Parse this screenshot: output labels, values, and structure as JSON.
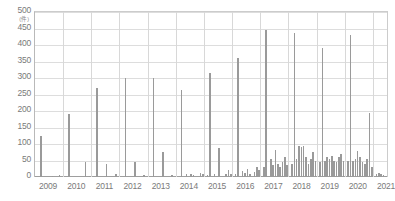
{
  "chart_data": {
    "type": "bar",
    "title": "",
    "subtitle": "",
    "xlabel": "",
    "ylabel": "",
    "yunit": "(件)",
    "ylim": [
      0,
      500
    ],
    "ytick_step": 50,
    "yticks": [
      0,
      50,
      100,
      150,
      200,
      250,
      300,
      350,
      400,
      450,
      500
    ],
    "ytick_labels": [
      "0",
      "50",
      "100",
      "150",
      "200",
      "250",
      "300",
      "350",
      "400",
      "450",
      "500"
    ],
    "xticks": [
      2009,
      2010,
      2011,
      2012,
      2013,
      2014,
      2015,
      2016,
      2017,
      2018,
      2019,
      2020,
      2021
    ],
    "xtick_labels": [
      "2009",
      "2010",
      "2011",
      "2012",
      "2013",
      "2014",
      "2015",
      "2016",
      "2017",
      "2018",
      "2019",
      "2020",
      "2021"
    ],
    "grid": true,
    "legend": null,
    "bar_color": "#9a9a9a",
    "grid_color": "#dddddd",
    "axis_color": "#9e9e9e",
    "x_period": "monthly",
    "x_start": "2009-01",
    "x_end": "2021-06",
    "categories": [
      "2009-01",
      "2009-02",
      "2009-03",
      "2009-04",
      "2009-05",
      "2009-06",
      "2009-07",
      "2009-08",
      "2009-09",
      "2009-10",
      "2009-11",
      "2009-12",
      "2010-01",
      "2010-02",
      "2010-03",
      "2010-04",
      "2010-05",
      "2010-06",
      "2010-07",
      "2010-08",
      "2010-09",
      "2010-10",
      "2010-11",
      "2010-12",
      "2011-01",
      "2011-02",
      "2011-03",
      "2011-04",
      "2011-05",
      "2011-06",
      "2011-07",
      "2011-08",
      "2011-09",
      "2011-10",
      "2011-11",
      "2011-12",
      "2012-01",
      "2012-02",
      "2012-03",
      "2012-04",
      "2012-05",
      "2012-06",
      "2012-07",
      "2012-08",
      "2012-09",
      "2012-10",
      "2012-11",
      "2012-12",
      "2013-01",
      "2013-02",
      "2013-03",
      "2013-04",
      "2013-05",
      "2013-06",
      "2013-07",
      "2013-08",
      "2013-09",
      "2013-10",
      "2013-11",
      "2013-12",
      "2014-01",
      "2014-02",
      "2014-03",
      "2014-04",
      "2014-05",
      "2014-06",
      "2014-07",
      "2014-08",
      "2014-09",
      "2014-10",
      "2014-11",
      "2014-12",
      "2015-01",
      "2015-02",
      "2015-03",
      "2015-04",
      "2015-05",
      "2015-06",
      "2015-07",
      "2015-08",
      "2015-09",
      "2015-10",
      "2015-11",
      "2015-12",
      "2016-01",
      "2016-02",
      "2016-03",
      "2016-04",
      "2016-05",
      "2016-06",
      "2016-07",
      "2016-08",
      "2016-09",
      "2016-10",
      "2016-11",
      "2016-12",
      "2017-01",
      "2017-02",
      "2017-03",
      "2017-04",
      "2017-05",
      "2017-06",
      "2017-07",
      "2017-08",
      "2017-09",
      "2017-10",
      "2017-11",
      "2017-12",
      "2018-01",
      "2018-02",
      "2018-03",
      "2018-04",
      "2018-05",
      "2018-06",
      "2018-07",
      "2018-08",
      "2018-09",
      "2018-10",
      "2018-11",
      "2018-12",
      "2019-01",
      "2019-02",
      "2019-03",
      "2019-04",
      "2019-05",
      "2019-06",
      "2019-07",
      "2019-08",
      "2019-09",
      "2019-10",
      "2019-11",
      "2019-12",
      "2020-01",
      "2020-02",
      "2020-03",
      "2020-04",
      "2020-05",
      "2020-06",
      "2020-07",
      "2020-08",
      "2020-09",
      "2020-10",
      "2020-11",
      "2020-12",
      "2021-01",
      "2021-02",
      "2021-03",
      "2021-04",
      "2021-05",
      "2021-06"
    ],
    "values": [
      0,
      0,
      125,
      0,
      0,
      0,
      0,
      3,
      0,
      0,
      5,
      0,
      0,
      0,
      190,
      0,
      0,
      0,
      0,
      0,
      0,
      45,
      0,
      3,
      0,
      0,
      270,
      0,
      0,
      0,
      40,
      0,
      0,
      0,
      8,
      0,
      0,
      0,
      300,
      0,
      0,
      0,
      45,
      0,
      0,
      0,
      5,
      0,
      0,
      0,
      300,
      0,
      0,
      0,
      75,
      0,
      0,
      0,
      6,
      0,
      0,
      0,
      265,
      0,
      8,
      0,
      10,
      5,
      0,
      0,
      12,
      8,
      0,
      5,
      315,
      0,
      8,
      0,
      88,
      0,
      0,
      10,
      20,
      8,
      0,
      10,
      360,
      0,
      18,
      12,
      25,
      10,
      0,
      15,
      30,
      20,
      0,
      30,
      445,
      0,
      55,
      35,
      82,
      40,
      30,
      45,
      60,
      35,
      0,
      40,
      435,
      55,
      95,
      90,
      95,
      60,
      40,
      55,
      75,
      50,
      0,
      45,
      390,
      50,
      60,
      55,
      65,
      50,
      45,
      60,
      70,
      48,
      0,
      50,
      430,
      48,
      55,
      80,
      60,
      45,
      40,
      55,
      195,
      30,
      0,
      10,
      12,
      8,
      5,
      3
    ]
  }
}
